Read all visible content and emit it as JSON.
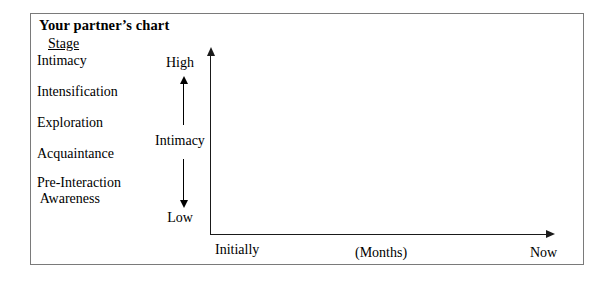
{
  "chart_data": {
    "type": "line",
    "xlabel": "(Months)",
    "ylabel": "Intimacy",
    "subtitle": "Stage",
    "grid": false,
    "legend": "none",
    "series": [],
    "x": [],
    "values": [],
    "x_tick_labels": [
      "Initially",
      "(Months)",
      "Now"
    ],
    "y_tick_labels": [
      "High",
      "Low"
    ],
    "ylim": [
      "Low",
      "High"
    ],
    "xlim": [
      "Initially",
      "Now"
    ],
    "annotations": [],
    "note": "Blank worksheet chart: axes drawn with no data plotted",
    "stage_axis_categories": [
      "Intimacy",
      "Intensification",
      "Exploration",
      "Acquaintance",
      "Pre-Interaction\n Awareness"
    ]
  },
  "worksheet": {
    "title": "Your partner’s chart",
    "stage_header": "Stage",
    "stages": [
      {
        "label": "Intimacy"
      },
      {
        "label": "Intensification"
      },
      {
        "label": "Exploration"
      },
      {
        "label": "Acquaintance"
      },
      {
        "label": "Pre-Interaction\n Awareness"
      }
    ],
    "scale": {
      "high": "High",
      "axis_label": "Intimacy",
      "low": "Low"
    },
    "x_axis": {
      "start": "Initially",
      "middle": "(Months)",
      "end": "Now"
    }
  },
  "colors": {
    "frame": "#7a7a7a",
    "axis": "#1a1a1a",
    "text": "#000000",
    "background": "#ffffff"
  }
}
